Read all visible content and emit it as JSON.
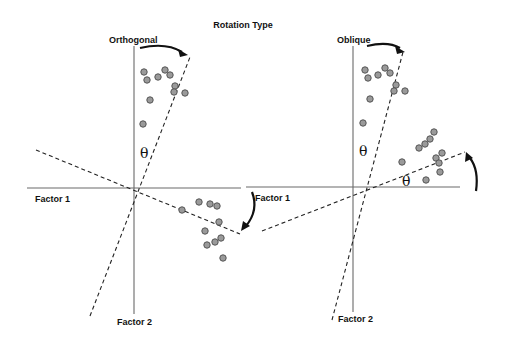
{
  "title": "Rotation Type",
  "panels": {
    "orthogonal": {
      "label": "Orthogonal",
      "x_axis_label": "Factor 1",
      "y_axis_label": "Factor 2",
      "angle_symbol": "θ",
      "cluster_top": [
        [
          144,
          72
        ],
        [
          147,
          80
        ],
        [
          158,
          77
        ],
        [
          165,
          70
        ],
        [
          170,
          75
        ],
        [
          175,
          86
        ],
        [
          174,
          92
        ],
        [
          185,
          93
        ],
        [
          150,
          100
        ],
        [
          143,
          124
        ]
      ],
      "cluster_bottom": [
        [
          182,
          210
        ],
        [
          199,
          202
        ],
        [
          210,
          204
        ],
        [
          217,
          206
        ],
        [
          219,
          222
        ],
        [
          205,
          231
        ],
        [
          207,
          245
        ],
        [
          215,
          242
        ],
        [
          221,
          238
        ],
        [
          223,
          258
        ]
      ]
    },
    "oblique": {
      "label": "Oblique",
      "x_axis_label": "Factor 1",
      "y_axis_label": "Factor 2",
      "angle_symbol_vertical": "θ",
      "angle_symbol_horizontal": "θ",
      "cluster_top": [
        [
          365,
          70
        ],
        [
          368,
          78
        ],
        [
          378,
          75
        ],
        [
          385,
          68
        ],
        [
          390,
          73
        ],
        [
          396,
          85
        ],
        [
          394,
          91
        ],
        [
          405,
          91
        ],
        [
          370,
          99
        ],
        [
          363,
          123
        ]
      ],
      "cluster_right": [
        [
          419,
          148
        ],
        [
          425,
          144
        ],
        [
          430,
          139
        ],
        [
          434,
          132
        ],
        [
          402,
          162
        ],
        [
          436,
          158
        ],
        [
          442,
          153
        ],
        [
          439,
          163
        ],
        [
          440,
          172
        ],
        [
          426,
          180
        ]
      ]
    }
  },
  "colors": {
    "axis": "#6a6a6a",
    "dot_fill": "#9a9a9a",
    "dot_stroke": "#555555",
    "text": "#111111"
  }
}
